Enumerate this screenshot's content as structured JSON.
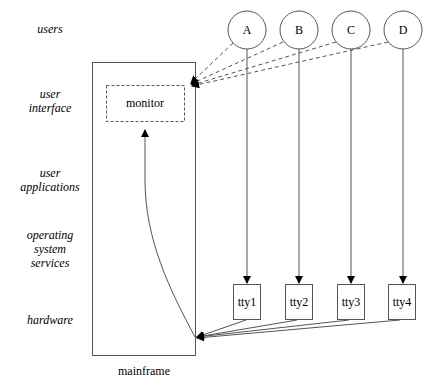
{
  "layers": [
    {
      "id": "users",
      "lines": [
        "users"
      ],
      "top": 22
    },
    {
      "id": "user-interface",
      "lines": [
        "user",
        "interface"
      ],
      "top": 87
    },
    {
      "id": "user-applications",
      "lines": [
        "user",
        "applications"
      ],
      "top": 166
    },
    {
      "id": "operating-system-services",
      "lines": [
        "operating",
        "system",
        "services"
      ],
      "top": 228
    },
    {
      "id": "hardware",
      "lines": [
        "hardware"
      ],
      "top": 313
    }
  ],
  "nodes": {
    "mainframe": {
      "label": "mainframe"
    },
    "monitor": {
      "label": "monitor"
    },
    "users": [
      {
        "label": "A"
      },
      {
        "label": "B"
      },
      {
        "label": "C"
      },
      {
        "label": "D"
      }
    ],
    "terminals": [
      {
        "label": "tty1"
      },
      {
        "label": "tty2"
      },
      {
        "label": "tty3"
      },
      {
        "label": "tty4"
      }
    ]
  },
  "edges": {
    "user_to_tty": [
      "A->tty1",
      "B->tty2",
      "C->tty3",
      "D->tty4"
    ],
    "user_to_monitor_dashed": [
      "A->monitor",
      "B->monitor",
      "C->monitor",
      "D->monitor"
    ],
    "tty_to_mainframe": [
      "tty1->mainframe",
      "tty2->mainframe",
      "tty3->mainframe",
      "tty4->mainframe"
    ],
    "mainframe_to_monitor": [
      "mainframe->monitor"
    ]
  },
  "colors": {
    "stroke": "#555555",
    "arrow": "#000000",
    "background": "#ffffff"
  }
}
